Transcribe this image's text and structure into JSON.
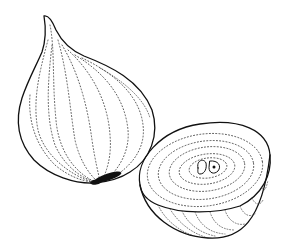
{
  "illustration": {
    "subject": "onion",
    "style": "black and white stipple line drawing",
    "parts": [
      {
        "name": "whole onion",
        "position": "left"
      },
      {
        "name": "halved onion",
        "position": "right"
      }
    ],
    "colors": {
      "background": "#ffffff",
      "ink": "#111111"
    }
  }
}
